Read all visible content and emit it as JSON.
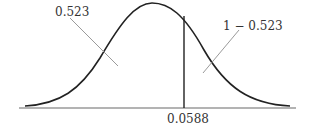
{
  "diagram": {
    "type": "normal-distribution-curve",
    "labels": {
      "left_area": "0.523",
      "right_area": "1 − 0.523",
      "cutoff": "0.0588"
    },
    "colors": {
      "curve": "#222222",
      "axis": "#999999",
      "leader": "#9a9a9a",
      "divider": "#222222",
      "text": "#333333"
    }
  }
}
